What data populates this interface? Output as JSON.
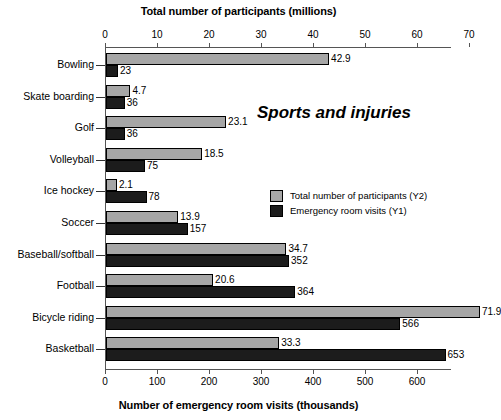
{
  "chart_data": {
    "type": "bar",
    "orientation": "horizontal",
    "title": "Sports and injuries",
    "annotation": "Sports and injuries",
    "grid": false,
    "legend_position": "center-right",
    "top_axis": {
      "label": "Total number of participants (millions)",
      "ticks": [
        "0",
        "10",
        "20",
        "30",
        "40",
        "50",
        "60",
        "70"
      ],
      "tick_values": [
        0,
        10,
        20,
        30,
        40,
        50,
        60,
        70
      ],
      "range": [
        0,
        78
      ]
    },
    "bottom_axis": {
      "label": "Number of emergency room visits (thousands)",
      "ticks": [
        "0",
        "100",
        "200",
        "300",
        "400",
        "500",
        "600"
      ],
      "tick_values": [
        0,
        100,
        200,
        300,
        400,
        500,
        600
      ],
      "range": [
        0,
        670
      ]
    },
    "categories": [
      "Bowling",
      "Skate boarding",
      "Golf",
      "Volleyball",
      "Ice hockey",
      "Soccer",
      "Baseball/softball",
      "Football",
      "Bicycle riding",
      "Basketball"
    ],
    "series": [
      {
        "name": "Total number of participants (Y2)",
        "axis": "top",
        "unit": "millions",
        "color": "#a6a6a6",
        "values": [
          42.9,
          4.7,
          23.1,
          18.5,
          2.1,
          13.9,
          34.7,
          20.6,
          71.9,
          33.3
        ],
        "labels": [
          "42.9",
          "4.7",
          "23.1",
          "18.5",
          "2.1",
          "13.9",
          "34.7",
          "20.6",
          "71.9",
          "33.3"
        ]
      },
      {
        "name": "Emergency room visits (Y1)",
        "axis": "bottom",
        "unit": "thousands",
        "color": "#1c1c1c",
        "values": [
          23,
          36,
          36,
          75,
          78,
          157,
          352,
          364,
          566,
          653
        ],
        "labels": [
          "23",
          "36",
          "36",
          "75",
          "78",
          "157",
          "352",
          "364",
          "566",
          "653"
        ]
      }
    ],
    "legend": [
      "Total number of participants (Y2)",
      "Emergency room visits (Y1)"
    ]
  }
}
